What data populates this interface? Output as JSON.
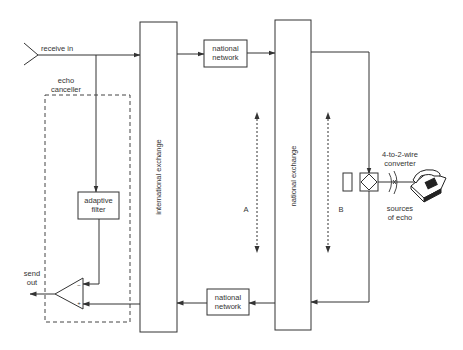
{
  "diagram": {
    "type": "block-diagram",
    "title": "",
    "colors": {
      "line": "#333333",
      "dashed": "#444444",
      "background": "#ffffff"
    },
    "labels": {
      "receive_in": "receive in",
      "echo_canceller_line1": "echo",
      "echo_canceller_line2": "canceller",
      "adaptive_filter_line1": "adaptive",
      "adaptive_filter_line2": "filter",
      "send_out_line1": "send",
      "send_out_line2": "out",
      "international_exchange": "international exchange",
      "national_exchange": "national exchange",
      "national_network_top_line1": "national",
      "national_network_top_line2": "network",
      "national_network_bottom_line1": "national",
      "national_network_bottom_line2": "network",
      "path_a": "A",
      "path_b": "B",
      "converter_line1": "4-to-2-wire",
      "converter_line2": "converter",
      "sources_line1": "sources",
      "sources_line2": "of echo",
      "subtractor_minus": "−",
      "subtractor_plus": "+"
    },
    "nodes": [
      {
        "id": "receive-in",
        "label": "receive in"
      },
      {
        "id": "echo-canceller",
        "label": "echo canceller",
        "style": "dashed-group"
      },
      {
        "id": "adaptive-filter",
        "label": "adaptive filter"
      },
      {
        "id": "subtractor",
        "label": "subtractor (triangle)"
      },
      {
        "id": "international-exchange",
        "label": "international exchange"
      },
      {
        "id": "national-network-top",
        "label": "national network"
      },
      {
        "id": "national-exchange",
        "label": "national exchange"
      },
      {
        "id": "national-network-bottom",
        "label": "national network"
      },
      {
        "id": "converter",
        "label": "4-to-2-wire converter"
      },
      {
        "id": "telephone",
        "label": "telephone"
      },
      {
        "id": "send-out",
        "label": "send out"
      }
    ],
    "edges": [
      {
        "from": "receive-in",
        "to": "international-exchange"
      },
      {
        "from": "receive-in",
        "to": "adaptive-filter"
      },
      {
        "from": "international-exchange",
        "to": "national-network-top"
      },
      {
        "from": "national-network-top",
        "to": "national-exchange"
      },
      {
        "from": "national-exchange",
        "to": "converter"
      },
      {
        "from": "converter",
        "to": "national-exchange"
      },
      {
        "from": "national-exchange",
        "to": "national-network-bottom"
      },
      {
        "from": "national-network-bottom",
        "to": "international-exchange"
      },
      {
        "from": "international-exchange",
        "to": "subtractor"
      },
      {
        "from": "adaptive-filter",
        "to": "subtractor"
      },
      {
        "from": "subtractor",
        "to": "send-out"
      }
    ]
  }
}
